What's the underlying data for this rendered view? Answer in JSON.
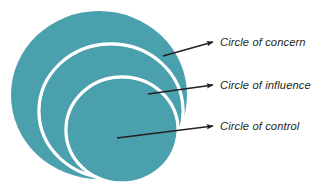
{
  "diagram": {
    "background_color": "#ffffff",
    "fill_color": "#4ba0ae",
    "ring_color": "#ffffff",
    "arrow_color": "#231f20",
    "text_color": "#231f20",
    "circles": [
      {
        "id": "circle-of-concern",
        "label": "Circle of concern",
        "cx": 99,
        "cy": 95,
        "rx": 88,
        "ry": 84,
        "order": 1
      },
      {
        "id": "circle-of-influence",
        "label": "Circle of influence",
        "cx": 111,
        "cy": 111,
        "rx": 72,
        "ry": 67,
        "order": 2
      },
      {
        "id": "circle-of-control",
        "label": "Circle of control",
        "cx": 122,
        "cy": 130,
        "rx": 56,
        "ry": 53,
        "order": 3
      }
    ],
    "arrows": [
      {
        "id": "arrow-to-concern",
        "target": "Circle of concern",
        "x1": 163,
        "y1": 56,
        "x2": 213,
        "y2": 42
      },
      {
        "id": "arrow-to-influence",
        "target": "Circle of influence",
        "x1": 148,
        "y1": 94,
        "x2": 213,
        "y2": 85
      },
      {
        "id": "arrow-to-control",
        "target": "Circle of control",
        "x1": 117,
        "y1": 138,
        "x2": 213,
        "y2": 126
      }
    ],
    "labels": [
      {
        "id": "label-concern",
        "text": "Circle of concern",
        "x": 220,
        "y": 43
      },
      {
        "id": "label-influence",
        "text": "Circle of influence",
        "x": 220,
        "y": 86
      },
      {
        "id": "label-control",
        "text": "Circle of control",
        "x": 220,
        "y": 127
      }
    ]
  }
}
